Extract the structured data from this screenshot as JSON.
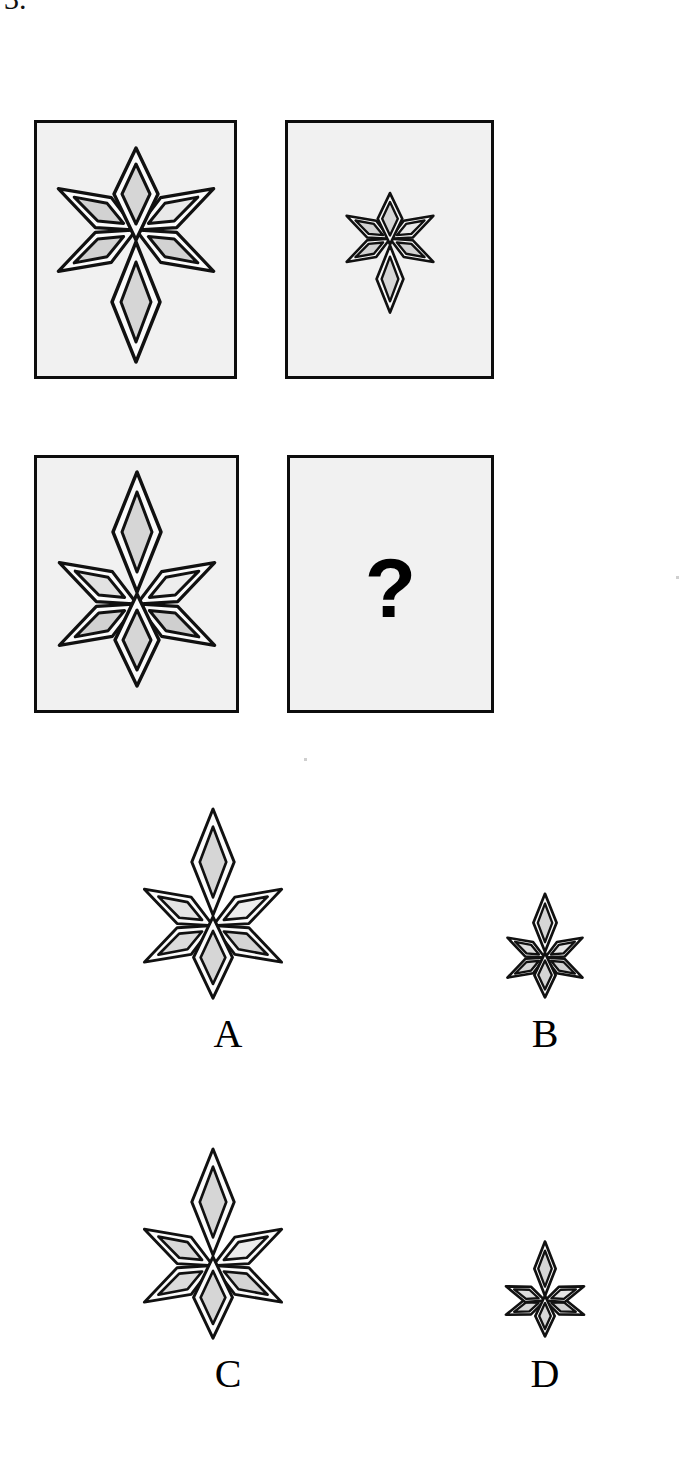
{
  "item": {
    "number": "3.",
    "type": "figural-analogy-matrix",
    "question_mark": "?"
  },
  "palette": {
    "page_background": "#ffffff",
    "panel_background": "#f1f1f1",
    "panel_border": "#0d0d0d",
    "ink": "#000000",
    "fill_light": "#ececec",
    "fill_mid": "#dedede",
    "fill_dark": "#cccccc",
    "ring_white": "#fbfbfb"
  },
  "matrix": {
    "rows": 2,
    "cols": 2,
    "cells": [
      {
        "id": "panel-1",
        "name": "matrix-cell-a1",
        "content": "star-figure",
        "scale": 1.0,
        "orientation": "tail-down",
        "description": "Large five-lobe diamond star with long tail diamond pointing down"
      },
      {
        "id": "panel-2",
        "name": "matrix-cell-a2",
        "content": "star-figure",
        "scale": 0.5,
        "orientation": "tail-down",
        "description": "Small five-lobe diamond star with long tail diamond pointing down"
      },
      {
        "id": "panel-3",
        "name": "matrix-cell-b1",
        "content": "star-figure",
        "scale": 1.0,
        "orientation": "tail-up",
        "description": "Large five-lobe diamond star with long tail diamond pointing up"
      },
      {
        "id": "panel-4",
        "name": "matrix-cell-b2",
        "content": "question-mark",
        "scale": 0.5,
        "orientation": "tail-up",
        "description": "Unknown cell marked with a question mark"
      }
    ]
  },
  "options": [
    {
      "letter": "A",
      "scale": 1.0,
      "orientation": "tail-up",
      "spread": "normal",
      "description": "Large star, tail diamond pointing up"
    },
    {
      "letter": "B",
      "scale": 0.5,
      "orientation": "tail-up",
      "spread": "normal",
      "description": "Small star, tail diamond pointing up"
    },
    {
      "letter": "C",
      "scale": 1.0,
      "orientation": "tail-up",
      "spread": "normal",
      "description": "Large star, tail diamond pointing up"
    },
    {
      "letter": "D",
      "scale": 0.5,
      "orientation": "tail-up",
      "spread": "wide",
      "description": "Small star, tail diamond pointing up, side lobes spread wider"
    }
  ]
}
